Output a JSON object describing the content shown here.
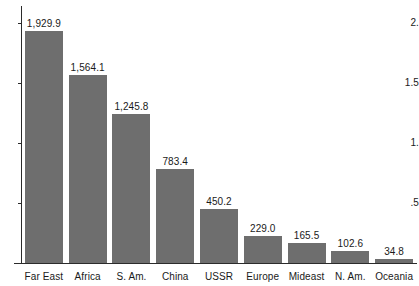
{
  "chart_data": {
    "type": "bar",
    "title": "",
    "subtitle": "",
    "xlabel": "",
    "ylabel": "",
    "categories": [
      "Far East",
      "Africa",
      "S. Am.",
      "China",
      "USSR",
      "Europe",
      "Mideast",
      "N. Am.",
      "Oceania"
    ],
    "values": [
      1929.9,
      1564.1,
      1245.8,
      783.4,
      450.2,
      229.0,
      165.5,
      102.6,
      34.8
    ],
    "value_labels": [
      "1,929.9",
      "1,564.1",
      "1,245.8",
      "783.4",
      "450.2",
      "229.0",
      "165.5",
      "102.6",
      "34.8"
    ],
    "ylim": [
      0,
      2100
    ],
    "y_tick_values": [
      2000,
      1500,
      1000,
      500
    ],
    "y_tick_labels": [
      "2.",
      "1.5",
      "1.",
      ".5"
    ],
    "grid": false,
    "legend": "none",
    "bar_color": "#6e6e6e",
    "axis_color": "#2b2b2b",
    "text_color": "#1a1a1a",
    "background_color": "#ffffff"
  }
}
